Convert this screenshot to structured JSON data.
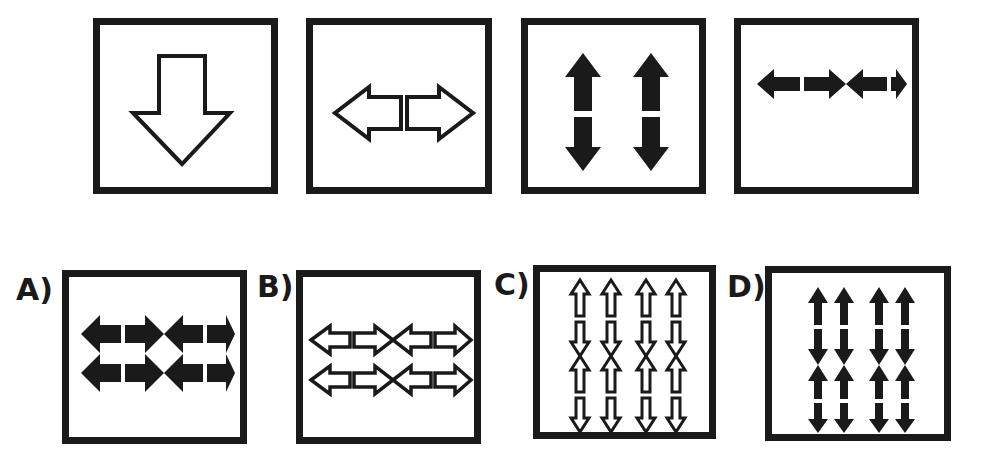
{
  "puzzle": {
    "question_row": [
      {
        "id": "q1",
        "figure": "single-hollow-down-arrow",
        "fill": "hollow",
        "count": 1
      },
      {
        "id": "q2",
        "figure": "hollow-double-headed-horizontal-arrow-split",
        "fill": "hollow",
        "count": 1
      },
      {
        "id": "q3",
        "figure": "two-solid-vertical-double-headed-arrows",
        "fill": "solid",
        "count": 2
      },
      {
        "id": "q4",
        "figure": "four-solid-horizontal-double-headed-arrows-2x2",
        "fill": "solid",
        "count": 4
      }
    ],
    "options": [
      {
        "label": "A)",
        "figure": "four-solid-horizontal-double-headed-arrows-2x2",
        "fill": "solid"
      },
      {
        "label": "B)",
        "figure": "four-hollow-horizontal-double-headed-arrows-2x2",
        "fill": "hollow"
      },
      {
        "label": "C)",
        "figure": "eight-hollow-vertical-double-headed-arrows-4x2",
        "fill": "hollow"
      },
      {
        "label": "D)",
        "figure": "eight-solid-vertical-double-headed-arrows-4x2",
        "fill": "solid"
      }
    ]
  },
  "colors": {
    "ink": "#1a1a1a",
    "background": "#ffffff"
  }
}
